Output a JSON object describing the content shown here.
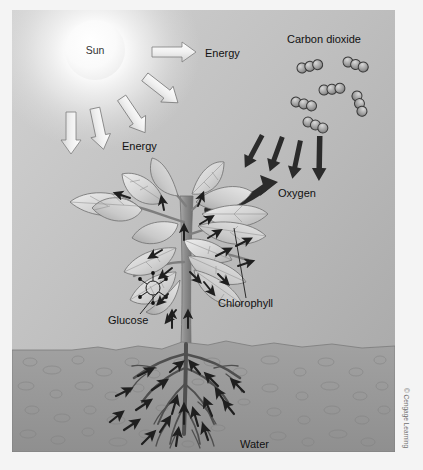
{
  "figure": {
    "labels": {
      "sun": "Sun",
      "energy_top": "Energy",
      "energy_lower": "Energy",
      "carbon_dioxide": "Carbon dioxide",
      "oxygen": "Oxygen",
      "chlorophyll": "Chlorophyll",
      "glucose": "Glucose",
      "water": "Water"
    },
    "credit": "© Cengage Learning",
    "colors": {
      "sky_light": "#d8d8d8",
      "sky_dark": "#a8a8a8",
      "sun_core": "#ffffff",
      "sun_glow": "#f0f0f0",
      "soil": "#9a9a9a",
      "soil_dark": "#7d7d7d",
      "leaf_light": "#e6e6e6",
      "leaf_mid": "#c4c4c4",
      "leaf_dark": "#9d9d9d",
      "stem": "#8a8a8a",
      "root": "#585858",
      "arrow_light": "#ededed",
      "arrow_dark": "#2b2b2b",
      "outline": "#4a4a4a",
      "text": "#111111",
      "credit_text": "#6e6e6e"
    },
    "counts": {
      "energy_arrows": 5,
      "co2_molecules": 6,
      "co2_atoms_per_molecule": 3,
      "co2_intake_arrows": 4,
      "oxygen_arrows": 1
    }
  }
}
